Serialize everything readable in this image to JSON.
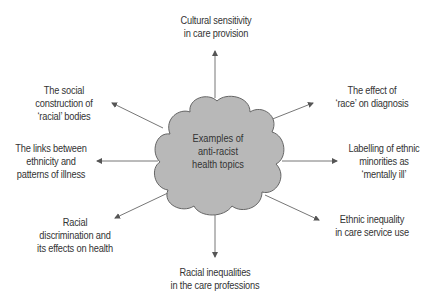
{
  "center": {
    "lines": [
      "Examples of",
      "anti-racist",
      "health topics"
    ]
  },
  "topics": [
    {
      "id": "top",
      "lines": [
        "Cultural sensitivity",
        "in care provision"
      ]
    },
    {
      "id": "upper-right",
      "lines": [
        "The effect of",
        "‘race’ on diagnosis"
      ]
    },
    {
      "id": "right",
      "lines": [
        "Labelling of ethnic",
        "minorities as",
        "‘mentally ill’"
      ]
    },
    {
      "id": "lower-right",
      "lines": [
        "Ethnic inequality",
        "in care service use"
      ]
    },
    {
      "id": "bottom",
      "lines": [
        "Racial inequalities",
        "in the care professions"
      ]
    },
    {
      "id": "lower-left",
      "lines": [
        "Racial",
        "discrimination and",
        "its effects on health"
      ]
    },
    {
      "id": "left",
      "lines": [
        "The links between",
        "ethnicity and",
        "patterns of illness"
      ]
    },
    {
      "id": "upper-left",
      "lines": [
        "The social",
        "construction of",
        "‘racial’ bodies"
      ]
    }
  ],
  "colors": {
    "cloud_fill": "#b8b8b8",
    "cloud_stroke": "#666666",
    "arrow": "#555555",
    "text": "#333333"
  }
}
